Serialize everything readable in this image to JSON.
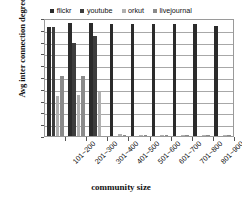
{
  "chart_data": {
    "type": "bar",
    "title": "",
    "xlabel": "community size",
    "ylabel": "Avg inter connection degree",
    "ylim": [
      0,
      1
    ],
    "ytick_labels": [
      "1",
      "0.9",
      "0.8",
      "0.7",
      "0.6",
      "0.5",
      "0.4",
      "0.3",
      "0.2",
      "0.1",
      "0"
    ],
    "ytick_values": [
      1,
      0.9,
      0.8,
      0.7,
      0.6,
      0.5,
      0.4,
      0.3,
      0.2,
      0.1,
      0
    ],
    "grid": true,
    "legend_position": "top-center",
    "categories": [
      "101~200",
      "201~300",
      "301~400",
      "401~500",
      "501~600",
      "601~700",
      "701~800",
      "801~900",
      "901~1000"
    ],
    "series": [
      {
        "name": "flickr",
        "color": "#2b2b2b",
        "values": [
          0.92,
          0.96,
          0.96,
          0.95,
          0.95,
          0.95,
          0.95,
          0.95,
          0.93
        ]
      },
      {
        "name": "youtube",
        "color": "#3d3d3d",
        "values": [
          0.92,
          0.79,
          0.85,
          0.0,
          0.0,
          0.0,
          0.0,
          0.0,
          0.0
        ]
      },
      {
        "name": "orkut",
        "color": "#b0b0b0",
        "values": [
          0.34,
          0.35,
          0.37,
          0.015,
          0.012,
          0.012,
          0.012,
          0.012,
          0.012
        ]
      },
      {
        "name": "livejournal",
        "color": "#8a8a8a",
        "values": [
          0.51,
          0.51,
          0.0,
          0.012,
          0.012,
          0.012,
          0.012,
          0.012,
          0.012
        ]
      }
    ]
  },
  "legend": {
    "items": [
      {
        "label": "flickr",
        "color": "#2b2b2b"
      },
      {
        "label": "youtube",
        "color": "#3d3d3d"
      },
      {
        "label": "orkut",
        "color": "#b0b0b0"
      },
      {
        "label": "livejournal",
        "color": "#8a8a8a"
      }
    ]
  },
  "axes": {
    "y_title": "Avg inter connection degree",
    "x_title": "community size"
  }
}
